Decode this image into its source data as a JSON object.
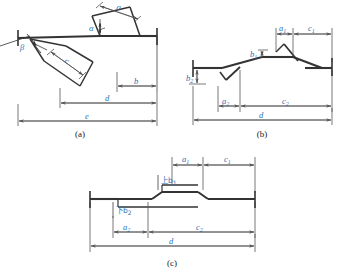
{
  "figure": {
    "title": "",
    "colors": {
      "label": "#2a6fb5",
      "outline": "#333333",
      "dimension": "#555555",
      "caption": "#222222",
      "background": "#ffffff"
    },
    "panels": [
      {
        "id": "a",
        "caption": "(a)",
        "labels": [
          {
            "name": "angle-alpha",
            "text": "α",
            "sub": ""
          },
          {
            "name": "angle-beta",
            "text": "β",
            "sub": ""
          },
          {
            "name": "dim-a",
            "text": "a",
            "sub": ""
          },
          {
            "name": "dim-c",
            "text": "c",
            "sub": ""
          },
          {
            "name": "dim-b",
            "text": "b",
            "sub": ""
          },
          {
            "name": "dim-d",
            "text": "d",
            "sub": ""
          },
          {
            "name": "dim-e",
            "text": "e",
            "sub": ""
          }
        ]
      },
      {
        "id": "b",
        "caption": "(b)",
        "labels": [
          {
            "name": "dim-a1",
            "text": "a",
            "sub": "1"
          },
          {
            "name": "dim-c1",
            "text": "c",
            "sub": "1"
          },
          {
            "name": "dim-b1",
            "text": "b",
            "sub": "1"
          },
          {
            "name": "dim-b2",
            "text": "b",
            "sub": "2"
          },
          {
            "name": "dim-a2",
            "text": "a",
            "sub": "2"
          },
          {
            "name": "dim-c2",
            "text": "c",
            "sub": "2"
          },
          {
            "name": "dim-d",
            "text": "d",
            "sub": ""
          }
        ]
      },
      {
        "id": "c",
        "caption": "(c)",
        "labels": [
          {
            "name": "dim-a1",
            "text": "a",
            "sub": "1"
          },
          {
            "name": "dim-c1",
            "text": "c",
            "sub": "1"
          },
          {
            "name": "dim-upper-b1",
            "text": "上b",
            "sub": "1"
          },
          {
            "name": "dim-lower-b2",
            "text": "下b",
            "sub": "2"
          },
          {
            "name": "dim-a2",
            "text": "a",
            "sub": "2"
          },
          {
            "name": "dim-c2",
            "text": "c",
            "sub": "2"
          },
          {
            "name": "dim-d",
            "text": "d",
            "sub": ""
          }
        ]
      }
    ]
  }
}
